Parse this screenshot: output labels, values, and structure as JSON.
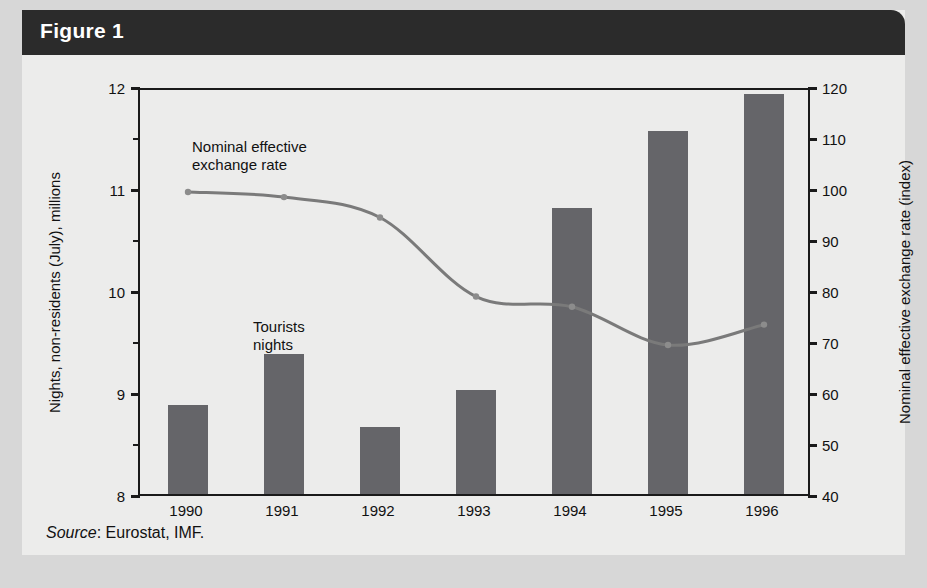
{
  "figure": {
    "title": "Figure 1",
    "source_prefix": "Source",
    "source_text": ": Eurostat, IMF."
  },
  "annotations": {
    "line_label_line1": "Nominal effective",
    "line_label_line2": "exchange rate",
    "bar_label_line1": "Tourists",
    "bar_label_line2": "nights"
  },
  "colors": {
    "bar": "#656569",
    "line": "#7a7a7a",
    "axis": "#1a1a1a",
    "title_band": "#2b2b2b",
    "panel": "#ececeb",
    "paper": "#d7d7d7",
    "title_text": "#ffffff"
  },
  "chart_data": {
    "type": "bar",
    "title": "Figure 1",
    "xlabel": "",
    "ylabel": "Nights, non-residents (July), millions",
    "y2label": "Nominal effective exchange rate (index)",
    "categories": [
      "1990",
      "1991",
      "1992",
      "1993",
      "1994",
      "1995",
      "1996"
    ],
    "ylim": [
      8,
      12
    ],
    "yticks": [
      8,
      9,
      10,
      11,
      12
    ],
    "yminorticks": [
      8.5,
      9.5,
      10.5,
      11.5
    ],
    "y2lim": [
      40,
      120
    ],
    "y2ticks": [
      40,
      50,
      60,
      70,
      80,
      90,
      100,
      110,
      120
    ],
    "grid": false,
    "legend": "annotations-inline",
    "series": [
      {
        "name": "Tourists nights",
        "type": "bar",
        "axis": "left",
        "unit": "millions",
        "values": [
          8.87,
          9.37,
          8.66,
          9.02,
          10.8,
          11.56,
          11.92
        ]
      },
      {
        "name": "Nominal effective exchange rate",
        "type": "line",
        "axis": "right",
        "unit": "index",
        "values": [
          100,
          99,
          95,
          79.5,
          77.5,
          70,
          74
        ]
      }
    ]
  }
}
